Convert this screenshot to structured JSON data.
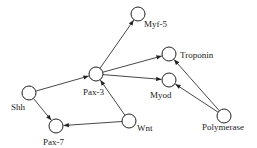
{
  "diagram": {
    "type": "directed-graph",
    "nodes": [
      {
        "id": "shh",
        "label": "Shh",
        "x": 29,
        "y": 93,
        "lx": 11,
        "ly": 110
      },
      {
        "id": "pax3",
        "label": "Pax-3",
        "x": 96,
        "y": 74,
        "lx": 83,
        "ly": 95
      },
      {
        "id": "pax7",
        "label": "Pax-7",
        "x": 56,
        "y": 126,
        "lx": 43,
        "ly": 145
      },
      {
        "id": "wnt",
        "label": "Wnt",
        "x": 129,
        "y": 121,
        "lx": 137,
        "ly": 131
      },
      {
        "id": "myf5",
        "label": "Myf-5",
        "x": 138,
        "y": 14,
        "lx": 144,
        "ly": 27
      },
      {
        "id": "troponin",
        "label": "Troponin",
        "x": 169,
        "y": 54,
        "lx": 180,
        "ly": 58
      },
      {
        "id": "myod",
        "label": "Myod",
        "x": 169,
        "y": 80,
        "lx": 150,
        "ly": 98
      },
      {
        "id": "polymerase",
        "label": "Polymerase",
        "x": 224,
        "y": 116,
        "lx": 202,
        "ly": 130
      }
    ],
    "edges": [
      {
        "from": "shh",
        "to": "pax3"
      },
      {
        "from": "shh",
        "to": "pax7"
      },
      {
        "from": "wnt",
        "to": "pax7"
      },
      {
        "from": "wnt",
        "to": "pax3"
      },
      {
        "from": "pax3",
        "to": "myf5"
      },
      {
        "from": "pax3",
        "to": "troponin"
      },
      {
        "from": "pax3",
        "to": "myod"
      },
      {
        "from": "polymerase",
        "to": "troponin"
      },
      {
        "from": "polymerase",
        "to": "myod"
      }
    ],
    "node_radius": 7
  }
}
